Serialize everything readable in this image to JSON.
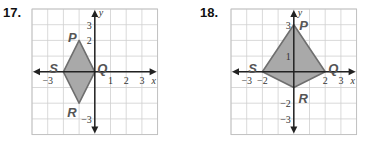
{
  "problems": [
    {
      "number": "17.",
      "grid": {
        "left": 32,
        "top": 9,
        "cell": 15.7,
        "xmin": -4,
        "xmax": 4,
        "ymin": -4,
        "ymax": 4
      },
      "axes": {
        "x_label": "x",
        "y_label": "y"
      },
      "x_ticks": [
        {
          "value": -3,
          "label": "−3"
        },
        {
          "value": 1,
          "label": "1"
        },
        {
          "value": 2,
          "label": "2"
        },
        {
          "value": 3,
          "label": "3"
        }
      ],
      "y_ticks": [
        {
          "value": 3,
          "label": "3"
        },
        {
          "value": 2,
          "label": "2"
        },
        {
          "value": -3,
          "label": "−3"
        }
      ],
      "vertices": [
        {
          "name": "P",
          "x": -1,
          "y": 2,
          "lx": -1.7,
          "ly": 2.2
        },
        {
          "name": "Q",
          "x": 0,
          "y": 0,
          "lx": 0.15,
          "ly": 0.25
        },
        {
          "name": "R",
          "x": -1,
          "y": -2,
          "lx": -1.75,
          "ly": -2.55
        },
        {
          "name": "S",
          "x": -2,
          "y": 0,
          "lx": -2.9,
          "ly": 0.25
        }
      ]
    },
    {
      "number": "18.",
      "grid": {
        "left": 231,
        "top": 9,
        "cell": 15.7,
        "xmin": -4,
        "xmax": 4,
        "ymin": -4,
        "ymax": 4
      },
      "axes": {
        "x_label": "x",
        "y_label": "y"
      },
      "x_ticks": [
        {
          "value": -3,
          "label": "−3"
        },
        {
          "value": -2,
          "label": "−2"
        },
        {
          "value": 2,
          "label": "2"
        },
        {
          "value": 3,
          "label": "3"
        }
      ],
      "y_ticks": [
        {
          "value": 3,
          "label": "3"
        },
        {
          "value": 1,
          "label": "1"
        },
        {
          "value": -2,
          "label": "−2"
        },
        {
          "value": -3,
          "label": "−3"
        }
      ],
      "vertices": [
        {
          "name": "P",
          "x": 0,
          "y": 3,
          "lx": 0.35,
          "ly": 2.95
        },
        {
          "name": "Q",
          "x": 2,
          "y": 0,
          "lx": 2.2,
          "ly": 0.25
        },
        {
          "name": "R",
          "x": 0,
          "y": -1,
          "lx": 0.3,
          "ly": -1.7
        },
        {
          "name": "S",
          "x": -2,
          "y": 0,
          "lx": -2.9,
          "ly": 0.25
        }
      ]
    }
  ],
  "colors": {
    "grid": "#cfcfcf",
    "border": "#bdbdbd",
    "axis": "#222222",
    "fill": "#a9a9a9",
    "stroke": "#6f6f6f"
  }
}
